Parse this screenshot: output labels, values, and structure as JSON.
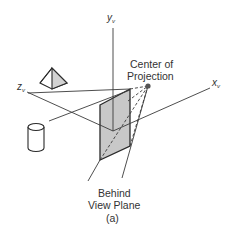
{
  "figure": {
    "caption": "(a)",
    "labels": {
      "y_axis": "y",
      "y_axis_sub": "v",
      "x_axis": "x",
      "x_axis_sub": "v",
      "z_axis": "z",
      "z_axis_sub": "v",
      "cop_line1": "Center of",
      "cop_line2": "Projection",
      "plane_line1": "Behind",
      "plane_line2": "View Plane"
    },
    "objects": [
      "pyramid",
      "cylinder",
      "view-plane",
      "center-of-projection"
    ],
    "colors": {
      "line": "#3a3a3a",
      "plane_fill": "#c8c8c8",
      "object_fill": "#d2d2d2",
      "background": "#ffffff"
    }
  }
}
